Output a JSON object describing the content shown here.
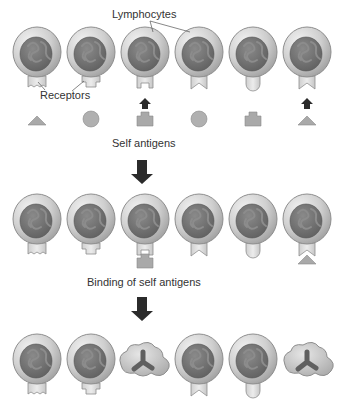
{
  "labels": {
    "lymphocytes": "Lymphocytes",
    "receptors": "Receptors",
    "self_antigens": "Self antigens",
    "binding": "Binding of self antigens"
  },
  "colors": {
    "cell_outer": "#c4c4c4",
    "cell_outer_rim": "#8e8e8e",
    "nucleus": "#6f6f6f",
    "nucleus_squiggle": "#8a8a8a",
    "receptor": "#d9d9d9",
    "antigen": "#a9a9a9",
    "arrow": "#2b2b2b",
    "text": "#333333"
  },
  "rows": [
    {
      "stage": "initial lymphocytes",
      "cells": [
        {
          "receptor": "notched-rect",
          "state": "alive"
        },
        {
          "receptor": "stepped-rect",
          "state": "alive"
        },
        {
          "receptor": "square-notch",
          "state": "alive"
        },
        {
          "receptor": "v-notch",
          "state": "alive"
        },
        {
          "receptor": "rounded",
          "state": "alive"
        },
        {
          "receptor": "v-notch",
          "state": "alive"
        }
      ]
    },
    {
      "stage": "self antigens",
      "antigens": [
        "triangle",
        "circle",
        "plus-block",
        "circle",
        "plus-block",
        "triangle"
      ],
      "binding_arrows_under_cells": [
        3,
        6
      ]
    },
    {
      "stage": "binding of self antigens",
      "cells": [
        {
          "receptor": "notched-rect",
          "state": "alive"
        },
        {
          "receptor": "stepped-rect",
          "state": "alive"
        },
        {
          "receptor": "square-notch",
          "state": "bound",
          "antigen": "plus-block"
        },
        {
          "receptor": "v-notch",
          "state": "alive"
        },
        {
          "receptor": "rounded",
          "state": "alive"
        },
        {
          "receptor": "v-notch",
          "state": "bound",
          "antigen": "triangle"
        }
      ]
    },
    {
      "stage": "deletion",
      "cells": [
        {
          "receptor": "notched-rect",
          "state": "alive"
        },
        {
          "receptor": "stepped-rect",
          "state": "alive"
        },
        {
          "receptor": null,
          "state": "apoptotic"
        },
        {
          "receptor": "v-notch",
          "state": "alive"
        },
        {
          "receptor": "rounded",
          "state": "alive"
        },
        {
          "receptor": null,
          "state": "apoptotic"
        }
      ]
    }
  ]
}
